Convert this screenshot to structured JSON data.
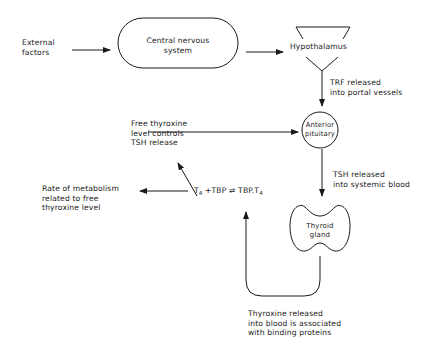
{
  "diagram": {
    "nodes": {
      "external_factors": [
        "External",
        "factors"
      ],
      "cns": [
        "Central nervous",
        "system"
      ],
      "hypothalamus": "Hypothalamus",
      "anterior_pituitary": [
        "Anterior",
        "pituitary"
      ],
      "thyroid": [
        "Thyroid",
        "gland"
      ]
    },
    "labels": {
      "trf": [
        "TRF released",
        "into portal vessels"
      ],
      "tsh": [
        "TSH released",
        "into systemic blood"
      ],
      "free_thyroxine": [
        "Free thyroxine",
        "level controls",
        "TSH release"
      ],
      "metabolism": [
        "Rate of metabolism",
        "related to free",
        "thyroxine level"
      ],
      "thyroxine_release": [
        "Thyroxine released",
        "into blood is associated",
        "with binding proteins"
      ]
    },
    "equation": {
      "t4": "T",
      "t4_sub": "4",
      "plus_tbp": "+TBP",
      "arrows": "⇌",
      "complex": "TBP.T",
      "complex_sub": "4"
    },
    "colors": {
      "ink": "#1a1a1a",
      "background": "#ffffff"
    }
  }
}
